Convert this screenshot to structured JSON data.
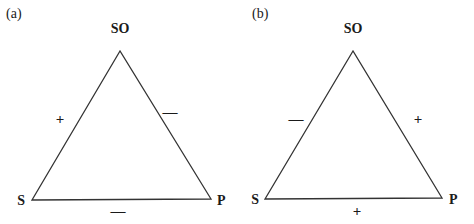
{
  "figure": {
    "panels": [
      {
        "label": "(a)",
        "vertices": {
          "top": "SO",
          "left": "S",
          "right": "P"
        },
        "edges": {
          "left": "+",
          "right": "—",
          "bottom": "—"
        }
      },
      {
        "label": "(b)",
        "vertices": {
          "top": "SO",
          "left": "S",
          "right": "P"
        },
        "edges": {
          "left": "—",
          "right": "+",
          "bottom": "+"
        }
      }
    ],
    "line_color": "#333333",
    "text_color": "#1a1a1a"
  }
}
